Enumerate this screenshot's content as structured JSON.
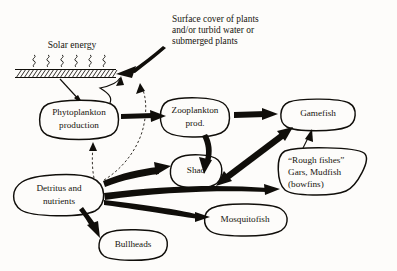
{
  "diagram": {
    "background_color": "#fdfcfa",
    "ink_color": "#100e0a"
  },
  "annotations": {
    "solar_energy": "Solar energy",
    "surface_cover_line1": "Surface cover of plants",
    "surface_cover_line2": "and/or turbid water or",
    "surface_cover_line3": "submerged plants"
  },
  "nodes": [
    {
      "id": "phytoplankton",
      "line1": "Phytoplankton",
      "line2": "production"
    },
    {
      "id": "zooplankton",
      "line1": "Zooplankton",
      "line2": "prod."
    },
    {
      "id": "gamefish",
      "line1": "Gamefish",
      "line2": ""
    },
    {
      "id": "shad",
      "line1": "Shad",
      "line2": ""
    },
    {
      "id": "rough_fishes",
      "line1": "“Rough fishes”",
      "line2": "Gars, Mudfish",
      "line3": "(bowfins)"
    },
    {
      "id": "detritus",
      "line1": "Detritus and",
      "line2": "nutrients"
    },
    {
      "id": "mosquitofish",
      "line1": "Mosquitofish",
      "line2": ""
    },
    {
      "id": "bullheads",
      "line1": "Bullheads",
      "line2": ""
    }
  ],
  "edges": [
    {
      "from": "surface",
      "to": "phytoplankton",
      "style": "solid-thin"
    },
    {
      "from": "phytoplankton",
      "to": "surface",
      "style": "solid-thin"
    },
    {
      "from": "surface_cover",
      "to": "surface",
      "style": "solid-thick"
    },
    {
      "from": "phytoplankton",
      "to": "zooplankton",
      "style": "solid-thick"
    },
    {
      "from": "detritus",
      "to": "phytoplankton",
      "style": "dashed"
    },
    {
      "from": "detritus",
      "to": "surface",
      "style": "dashed"
    },
    {
      "from": "zooplankton",
      "to": "gamefish",
      "style": "solid-thick"
    },
    {
      "from": "zooplankton",
      "to": "shad",
      "style": "solid-thick"
    },
    {
      "from": "shad",
      "to": "gamefish",
      "style": "solid-thick-bidirectional"
    },
    {
      "from": "rough_fishes",
      "to": "gamefish",
      "style": "solid-thin"
    },
    {
      "from": "detritus",
      "to": "shad",
      "style": "solid-thick"
    },
    {
      "from": "detritus",
      "to": "rough_fishes",
      "style": "solid-thin-long"
    },
    {
      "from": "detritus",
      "to": "mosquitofish",
      "style": "solid-thin-long"
    },
    {
      "from": "detritus",
      "to": "bullheads",
      "style": "solid-thick"
    }
  ]
}
